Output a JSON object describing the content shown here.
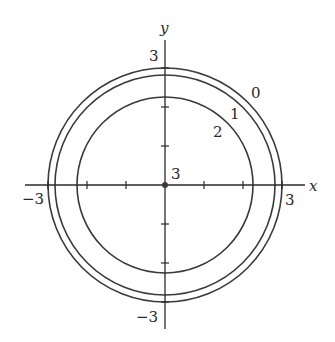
{
  "diagram": {
    "type": "level-curves",
    "axes": {
      "x_label": "x",
      "y_label": "y",
      "x_min_label": "−3",
      "x_max_label": "3",
      "y_min_label": "−3",
      "y_max_label": "3",
      "tick_values": [
        -2,
        -1,
        1,
        2
      ]
    },
    "origin_label": "3",
    "curves": [
      {
        "level": "0",
        "radius": 3.0
      },
      {
        "level": "1",
        "radius": 2.83
      },
      {
        "level": "2",
        "radius": 2.24
      }
    ],
    "colors": {
      "stroke": "#3a3a3a",
      "background": "#ffffff"
    }
  }
}
